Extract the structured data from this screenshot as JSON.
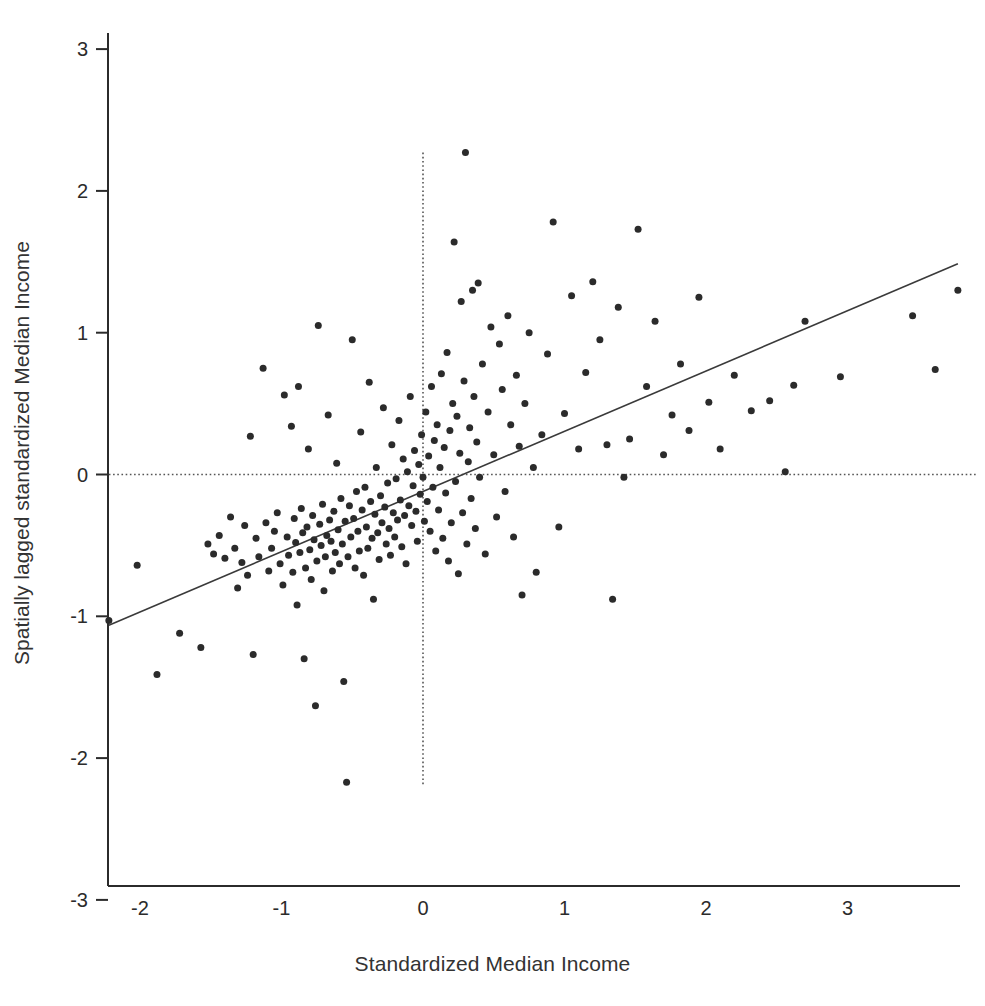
{
  "figure": {
    "background_color": "#ffffff",
    "ink_color": "#2b2b2b"
  },
  "axes": {
    "x_title": "Standardized Median Income",
    "y_title": "Spatially lagged standardized Median Income",
    "x_ticks": [
      "-2",
      "-1",
      "0",
      "1",
      "2",
      "3"
    ],
    "y_ticks": [
      "3",
      "2",
      "1",
      "0",
      "-1",
      "-2",
      "-3"
    ]
  },
  "chart_data": {
    "type": "scatter",
    "title": "",
    "xlabel": "Standardized Median Income",
    "ylabel": "Spatially lagged standardized Median Income",
    "xlim": [
      -2.22,
      3.92
    ],
    "ylim": [
      -3,
      3
    ],
    "xticks": [
      -2,
      -1,
      0,
      1,
      2,
      3
    ],
    "yticks": [
      -3,
      -2,
      -1,
      0,
      1,
      2,
      3
    ],
    "grid": false,
    "legend": null,
    "marker": {
      "shape": "circle",
      "color": "#2b2b2b",
      "size_px": 7
    },
    "reference_lines": [
      {
        "name": "mean-x-line",
        "orientation": "vertical",
        "value": 0,
        "style": "dotted",
        "color": "#555555",
        "y_from": 2.27,
        "y_to": -2.2
      },
      {
        "name": "mean-y-line",
        "orientation": "horizontal",
        "value": 0,
        "style": "dotted",
        "color": "#555555",
        "x_from": -2.22,
        "x_to": 3.92
      }
    ],
    "fit_line": {
      "name": "moran-regression-line",
      "style": "solid",
      "color": "#3a3a3a",
      "slope": 0.425,
      "intercept": -0.12,
      "x_from": -2.22,
      "x_to": 3.78
    },
    "points": [
      [
        -2.22,
        -1.03
      ],
      [
        -2.02,
        -0.64
      ],
      [
        -1.88,
        -1.41
      ],
      [
        -1.72,
        -1.12
      ],
      [
        -1.57,
        -1.22
      ],
      [
        -1.52,
        -0.49
      ],
      [
        -1.48,
        -0.56
      ],
      [
        -1.44,
        -0.43
      ],
      [
        -1.4,
        -0.59
      ],
      [
        -1.36,
        -0.3
      ],
      [
        -1.33,
        -0.52
      ],
      [
        -1.31,
        -0.8
      ],
      [
        -1.28,
        -0.62
      ],
      [
        -1.26,
        -0.36
      ],
      [
        -1.24,
        -0.71
      ],
      [
        -1.22,
        0.27
      ],
      [
        -1.2,
        -1.27
      ],
      [
        -1.18,
        -0.45
      ],
      [
        -1.16,
        -0.58
      ],
      [
        -1.13,
        0.75
      ],
      [
        -1.11,
        -0.34
      ],
      [
        -1.09,
        -0.68
      ],
      [
        -1.07,
        -0.52
      ],
      [
        -1.05,
        -0.4
      ],
      [
        -1.03,
        -0.27
      ],
      [
        -1.01,
        -0.63
      ],
      [
        -0.99,
        -0.78
      ],
      [
        -0.98,
        0.56
      ],
      [
        -0.96,
        -0.44
      ],
      [
        -0.95,
        -0.57
      ],
      [
        -0.93,
        0.34
      ],
      [
        -0.92,
        -0.69
      ],
      [
        -0.91,
        -0.31
      ],
      [
        -0.9,
        -0.48
      ],
      [
        -0.89,
        -0.92
      ],
      [
        -0.88,
        0.62
      ],
      [
        -0.87,
        -0.55
      ],
      [
        -0.86,
        -0.24
      ],
      [
        -0.85,
        -0.41
      ],
      [
        -0.84,
        -1.3
      ],
      [
        -0.83,
        -0.66
      ],
      [
        -0.82,
        -0.37
      ],
      [
        -0.81,
        0.18
      ],
      [
        -0.8,
        -0.53
      ],
      [
        -0.79,
        -0.74
      ],
      [
        -0.78,
        -0.29
      ],
      [
        -0.77,
        -0.46
      ],
      [
        -0.76,
        -1.63
      ],
      [
        -0.75,
        -0.61
      ],
      [
        -0.74,
        1.05
      ],
      [
        -0.73,
        -0.35
      ],
      [
        -0.72,
        -0.5
      ],
      [
        -0.71,
        -0.21
      ],
      [
        -0.7,
        -0.82
      ],
      [
        -0.69,
        -0.58
      ],
      [
        -0.68,
        -0.43
      ],
      [
        -0.67,
        0.42
      ],
      [
        -0.66,
        -0.32
      ],
      [
        -0.65,
        -0.47
      ],
      [
        -0.64,
        -0.68
      ],
      [
        -0.63,
        -0.26
      ],
      [
        -0.62,
        -0.55
      ],
      [
        -0.61,
        0.08
      ],
      [
        -0.6,
        -0.39
      ],
      [
        -0.59,
        -0.63
      ],
      [
        -0.58,
        -0.17
      ],
      [
        -0.57,
        -0.49
      ],
      [
        -0.56,
        -1.46
      ],
      [
        -0.55,
        -0.33
      ],
      [
        -0.54,
        -2.17
      ],
      [
        -0.53,
        -0.58
      ],
      [
        -0.52,
        -0.22
      ],
      [
        -0.51,
        -0.44
      ],
      [
        -0.5,
        0.95
      ],
      [
        -0.49,
        -0.31
      ],
      [
        -0.48,
        -0.66
      ],
      [
        -0.47,
        -0.12
      ],
      [
        -0.46,
        -0.4
      ],
      [
        -0.45,
        -0.54
      ],
      [
        -0.44,
        0.3
      ],
      [
        -0.43,
        -0.25
      ],
      [
        -0.42,
        -0.71
      ],
      [
        -0.41,
        -0.09
      ],
      [
        -0.4,
        -0.37
      ],
      [
        -0.39,
        -0.52
      ],
      [
        -0.38,
        0.65
      ],
      [
        -0.37,
        -0.19
      ],
      [
        -0.36,
        -0.45
      ],
      [
        -0.35,
        -0.88
      ],
      [
        -0.34,
        -0.28
      ],
      [
        -0.33,
        0.05
      ],
      [
        -0.32,
        -0.41
      ],
      [
        -0.31,
        -0.6
      ],
      [
        -0.3,
        -0.15
      ],
      [
        -0.29,
        -0.34
      ],
      [
        -0.28,
        0.47
      ],
      [
        -0.27,
        -0.23
      ],
      [
        -0.26,
        -0.49
      ],
      [
        -0.25,
        -0.06
      ],
      [
        -0.24,
        -0.38
      ],
      [
        -0.23,
        -0.57
      ],
      [
        -0.22,
        0.21
      ],
      [
        -0.21,
        -0.27
      ],
      [
        -0.2,
        -0.44
      ],
      [
        -0.19,
        -0.03
      ],
      [
        -0.18,
        -0.32
      ],
      [
        -0.17,
        0.38
      ],
      [
        -0.16,
        -0.18
      ],
      [
        -0.15,
        -0.51
      ],
      [
        -0.14,
        0.11
      ],
      [
        -0.13,
        -0.29
      ],
      [
        -0.12,
        -0.63
      ],
      [
        -0.11,
        0.02
      ],
      [
        -0.1,
        -0.22
      ],
      [
        -0.09,
        0.55
      ],
      [
        -0.08,
        -0.36
      ],
      [
        -0.07,
        -0.08
      ],
      [
        -0.06,
        0.17
      ],
      [
        -0.05,
        -0.26
      ],
      [
        -0.04,
        -0.47
      ],
      [
        -0.03,
        0.07
      ],
      [
        -0.02,
        -0.14
      ],
      [
        -0.01,
        0.28
      ],
      [
        0.0,
        -0.02
      ],
      [
        0.01,
        -0.33
      ],
      [
        0.02,
        0.44
      ],
      [
        0.03,
        -0.19
      ],
      [
        0.04,
        0.13
      ],
      [
        0.05,
        -0.4
      ],
      [
        0.06,
        0.62
      ],
      [
        0.07,
        -0.09
      ],
      [
        0.08,
        0.24
      ],
      [
        0.09,
        -0.54
      ],
      [
        0.1,
        0.35
      ],
      [
        0.11,
        -0.25
      ],
      [
        0.12,
        0.05
      ],
      [
        0.13,
        0.71
      ],
      [
        0.14,
        -0.45
      ],
      [
        0.15,
        0.19
      ],
      [
        0.16,
        -0.13
      ],
      [
        0.17,
        0.86
      ],
      [
        0.18,
        -0.61
      ],
      [
        0.19,
        0.31
      ],
      [
        0.2,
        -0.34
      ],
      [
        0.21,
        0.5
      ],
      [
        0.22,
        1.64
      ],
      [
        0.23,
        -0.05
      ],
      [
        0.24,
        0.41
      ],
      [
        0.25,
        -0.7
      ],
      [
        0.26,
        0.15
      ],
      [
        0.27,
        1.22
      ],
      [
        0.28,
        -0.27
      ],
      [
        0.29,
        0.66
      ],
      [
        0.3,
        2.27
      ],
      [
        0.31,
        -0.49
      ],
      [
        0.32,
        0.09
      ],
      [
        0.33,
        0.33
      ],
      [
        0.34,
        -0.17
      ],
      [
        0.35,
        1.3
      ],
      [
        0.36,
        0.55
      ],
      [
        0.37,
        -0.38
      ],
      [
        0.38,
        0.23
      ],
      [
        0.39,
        1.35
      ],
      [
        0.4,
        -0.02
      ],
      [
        0.42,
        0.78
      ],
      [
        0.44,
        -0.56
      ],
      [
        0.46,
        0.44
      ],
      [
        0.48,
        1.04
      ],
      [
        0.5,
        0.14
      ],
      [
        0.52,
        -0.3
      ],
      [
        0.54,
        0.92
      ],
      [
        0.56,
        0.6
      ],
      [
        0.58,
        -0.12
      ],
      [
        0.6,
        1.12
      ],
      [
        0.62,
        0.35
      ],
      [
        0.64,
        -0.44
      ],
      [
        0.66,
        0.7
      ],
      [
        0.68,
        0.2
      ],
      [
        0.7,
        -0.85
      ],
      [
        0.72,
        0.5
      ],
      [
        0.75,
        1.0
      ],
      [
        0.78,
        0.05
      ],
      [
        0.8,
        -0.69
      ],
      [
        0.84,
        0.28
      ],
      [
        0.88,
        0.85
      ],
      [
        0.92,
        1.78
      ],
      [
        0.96,
        -0.37
      ],
      [
        1.0,
        0.43
      ],
      [
        1.05,
        1.26
      ],
      [
        1.1,
        0.18
      ],
      [
        1.15,
        0.72
      ],
      [
        1.2,
        1.36
      ],
      [
        1.25,
        0.95
      ],
      [
        1.3,
        0.21
      ],
      [
        1.34,
        -0.88
      ],
      [
        1.38,
        1.18
      ],
      [
        1.42,
        -0.02
      ],
      [
        1.46,
        0.25
      ],
      [
        1.52,
        1.73
      ],
      [
        1.58,
        0.62
      ],
      [
        1.64,
        1.08
      ],
      [
        1.7,
        0.14
      ],
      [
        1.76,
        0.42
      ],
      [
        1.82,
        0.78
      ],
      [
        1.88,
        0.31
      ],
      [
        1.95,
        1.25
      ],
      [
        2.02,
        0.51
      ],
      [
        2.1,
        0.18
      ],
      [
        2.2,
        0.7
      ],
      [
        2.32,
        0.45
      ],
      [
        2.45,
        0.52
      ],
      [
        2.56,
        0.02
      ],
      [
        2.62,
        0.63
      ],
      [
        2.7,
        1.08
      ],
      [
        2.95,
        0.69
      ],
      [
        3.46,
        1.12
      ],
      [
        3.62,
        0.74
      ],
      [
        3.78,
        1.3
      ]
    ]
  }
}
